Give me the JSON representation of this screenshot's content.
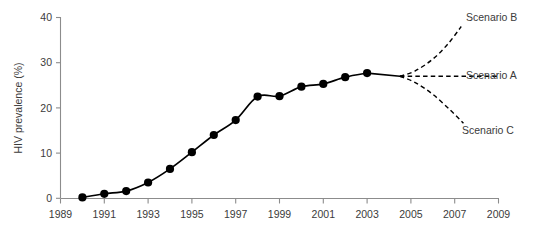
{
  "chart_data": {
    "type": "line",
    "title": "",
    "subtitle": "",
    "xlabel": "",
    "ylabel": "HIV prevalence (%)",
    "xlim": [
      1989,
      2009
    ],
    "ylim": [
      0,
      40
    ],
    "grid": false,
    "legend_position": "right-annotations",
    "x_ticks": [
      "1989",
      "1991",
      "1993",
      "1995",
      "1997",
      "1999",
      "2001",
      "2003",
      "2005",
      "2007",
      "2009"
    ],
    "x_tick_values": [
      1989,
      1991,
      1993,
      1995,
      1997,
      1999,
      2001,
      2003,
      2005,
      2007,
      2009
    ],
    "y_ticks": [
      "0",
      "10",
      "20",
      "30",
      "40"
    ],
    "y_tick_values": [
      0,
      10,
      20,
      30,
      40
    ],
    "series": [
      {
        "name": "Observed HIV prevalence",
        "style": "solid-line-with-markers",
        "color": "#000000",
        "x": [
          1990,
          1991,
          1992,
          1993,
          1994,
          1995,
          1996,
          1997,
          1998,
          1999,
          2000,
          2001,
          2002,
          2003
        ],
        "values": [
          0.2,
          1.0,
          1.6,
          3.5,
          6.5,
          10.2,
          14.0,
          17.3,
          22.5,
          22.6,
          24.7,
          25.3,
          26.8,
          27.7
        ]
      },
      {
        "name": "Scenario B",
        "style": "dashed",
        "color": "#000000",
        "x": [
          2004.5,
          2005.2,
          2006.0,
          2006.7,
          2007.3
        ],
        "values": [
          27.0,
          28.2,
          30.8,
          34.2,
          38.0
        ]
      },
      {
        "name": "Scenario A",
        "style": "dashed",
        "color": "#000000",
        "x": [
          2004.5,
          2009.0
        ],
        "values": [
          27.0,
          27.0
        ]
      },
      {
        "name": "Scenario C",
        "style": "dashed",
        "color": "#000000",
        "x": [
          2004.5,
          2005.2,
          2006.0,
          2006.8,
          2007.4
        ],
        "values": [
          27.0,
          25.6,
          23.0,
          19.5,
          16.6
        ]
      }
    ],
    "annotations": [
      {
        "label": "Scenario B",
        "x": 2007.6,
        "y": 38.5
      },
      {
        "label": "Scenario A",
        "x": 2009.2,
        "y": 27.0
      },
      {
        "label": "Scenario C",
        "x": 2007.6,
        "y": 15.2
      }
    ]
  },
  "axes": {
    "y_title": "HIV prevalence (%)",
    "y_tick_labels": [
      "40",
      "30",
      "20",
      "10",
      "0"
    ],
    "x_tick_labels": [
      "1989",
      "1991",
      "1993",
      "1995",
      "1997",
      "1999",
      "2001",
      "2003",
      "2005",
      "2007",
      "2009"
    ]
  },
  "scenarios": {
    "b_label": "Scenario B",
    "a_label": "Scenario A",
    "c_label": "Scenario C"
  },
  "colors": {
    "line": "#000000",
    "axis": "#8c8c8c",
    "text": "#3b3b3b",
    "background": "#ffffff"
  }
}
